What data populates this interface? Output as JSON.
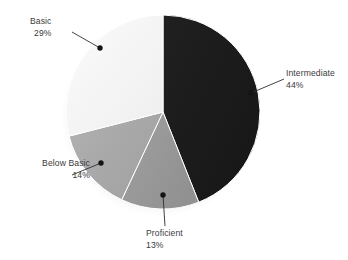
{
  "chart_data": {
    "type": "pie",
    "title": "",
    "subtitle": "",
    "xlabel": "",
    "ylabel": "",
    "legend_position": "none",
    "grid": false,
    "value_unit": "%",
    "categories": [
      "Intermediate",
      "Proficient",
      "Below Basic",
      "Basic"
    ],
    "values": [
      44,
      13,
      14,
      29
    ],
    "slices": [
      {
        "label": "Intermediate",
        "value": 44,
        "value_text": "44%",
        "color": "#1c1c1c",
        "start_angle_deg": 0,
        "end_angle_deg": 158.4,
        "label_align": "left"
      },
      {
        "label": "Proficient",
        "value": 13,
        "value_text": "13%",
        "color": "#9a9a9a",
        "start_angle_deg": 158.4,
        "end_angle_deg": 205.2,
        "label_align": "left"
      },
      {
        "label": "Below Basic",
        "value": 14,
        "value_text": "14%",
        "color": "#a9a9a9",
        "start_angle_deg": 205.2,
        "end_angle_deg": 255.6,
        "label_align": "right"
      },
      {
        "label": "Basic",
        "value": 29,
        "value_text": "29%",
        "color": "#f5f5f5",
        "start_angle_deg": 255.6,
        "end_angle_deg": 360,
        "label_align": "right"
      }
    ]
  },
  "colors": {
    "background": "#ffffff",
    "text": "#3b3b3b",
    "leader_line": "#2e2e2e",
    "marker_dot": "#141414",
    "slice_edge": "#ffffff",
    "shadow": "#b9b9b9"
  },
  "callouts": {
    "basic": {
      "label": "Basic",
      "percent": "29%"
    },
    "intermediate": {
      "label": "Intermediate",
      "percent": "44%"
    },
    "below_basic": {
      "label": "Below Basic",
      "percent": "14%"
    },
    "proficient": {
      "label": "Proficient",
      "percent": "13%"
    }
  }
}
